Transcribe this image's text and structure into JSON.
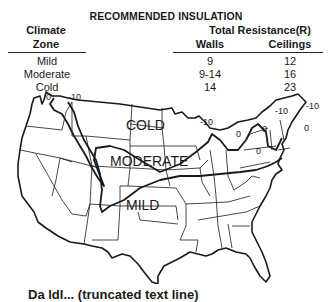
{
  "title": "RECOMMENDED INSULATION",
  "table": {
    "headers": {
      "zone_line1": "Climate",
      "zone_line2": "Zone",
      "total": "Total Resistance(R)",
      "walls": "Walls",
      "ceilings": "Ceilings"
    },
    "rows": [
      {
        "zone": "Mild",
        "walls": "9",
        "ceilings": "12"
      },
      {
        "zone": "Moderate",
        "walls": "9-14",
        "ceilings": "16"
      },
      {
        "zone": "Cold",
        "walls": "14",
        "ceilings": "23"
      }
    ]
  },
  "map": {
    "zone_labels": {
      "cold": "COLD",
      "moderate": "MODERATE",
      "mild": "MILD"
    },
    "isotherm_labels": {
      "nw_zero": "0",
      "nw_minus10": "-10",
      "lakes_minus10": "-10",
      "lakes_zero": "0",
      "ne_minus10_a": "-10",
      "ne_minus10_b": "-10",
      "ne_zero_a": "0",
      "ne_zero_b": "0",
      "ne_zero_c": "0"
    }
  },
  "caption": "Da ldl... (truncated text line)"
}
